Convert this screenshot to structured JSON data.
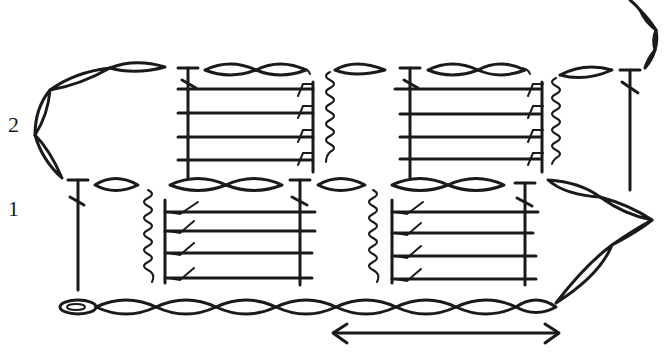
{
  "diagram": {
    "type": "crochet-chart",
    "background": "#ffffff",
    "ink_color": "#1a1a1a",
    "row_labels": [
      {
        "label": "2",
        "x": 8,
        "y": 112
      },
      {
        "label": "1",
        "x": 8,
        "y": 200
      }
    ],
    "repeat_arrow": {
      "x1": 335,
      "x2": 560,
      "y": 333,
      "symbol": "double-headed-arrow"
    },
    "foundation_chain": {
      "y": 307,
      "x_start": 60,
      "x_end": 555,
      "links": 10,
      "start_symbol": "slip-knot"
    },
    "row1": {
      "chain_top_y": 185,
      "blocks": [
        {
          "x": 165,
          "stitch_lines": 4,
          "symbol": "post-stitch-hook"
        },
        {
          "x": 390,
          "stitch_lines": 4,
          "symbol": "post-stitch-hook"
        }
      ],
      "spirals": [
        {
          "x": 155
        },
        {
          "x": 380
        }
      ],
      "verticals": [
        {
          "x": 78
        },
        {
          "x": 300
        },
        {
          "x": 525
        }
      ]
    },
    "row2": {
      "chain_top_y": 70,
      "blocks": [
        {
          "x": 180,
          "stitch_lines": 4,
          "symbol": "post-stitch-hook"
        },
        {
          "x": 400,
          "stitch_lines": 4,
          "symbol": "post-stitch-hook"
        }
      ],
      "spirals": [
        {
          "x": 320
        },
        {
          "x": 550
        }
      ],
      "verticals": [
        {
          "x": 188
        },
        {
          "x": 410
        },
        {
          "x": 630
        }
      ]
    },
    "turning_chains": [
      {
        "side": "left",
        "row": 2
      },
      {
        "side": "right",
        "row": 1
      },
      {
        "side": "top-right",
        "continuation": true
      }
    ]
  }
}
